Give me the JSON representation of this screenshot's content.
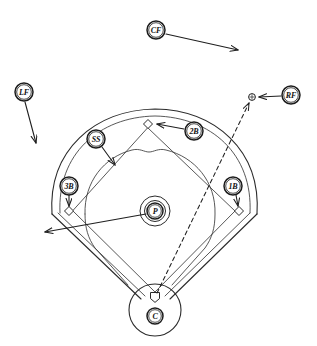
{
  "diagram": {
    "background_color": "#ffffff",
    "ink_color": "#1f1f1f",
    "width": 317,
    "height": 346
  },
  "positions": [
    {
      "id": "CF",
      "label": "CF",
      "name": "center-fielder",
      "badge": {
        "cx": 156,
        "cy": 30,
        "r": 9
      },
      "arrow": {
        "x1": 166,
        "y1": 34,
        "x2": 238,
        "y2": 50,
        "style": "solid",
        "head": "end"
      }
    },
    {
      "id": "LF",
      "label": "LF",
      "name": "left-fielder",
      "badge": {
        "cx": 24,
        "cy": 92,
        "r": 9
      },
      "arrow": {
        "x1": 25,
        "y1": 102,
        "x2": 36,
        "y2": 143,
        "style": "solid",
        "head": "end"
      }
    },
    {
      "id": "RF",
      "label": "RF",
      "name": "right-fielder",
      "badge": {
        "cx": 291,
        "cy": 95,
        "r": 9
      },
      "arrow": {
        "x1": 281,
        "y1": 96,
        "x2": 259,
        "y2": 97,
        "style": "solid",
        "head": "end"
      }
    },
    {
      "id": "2B",
      "label": "2B",
      "name": "second-baseman",
      "badge": {
        "cx": 194,
        "cy": 131,
        "r": 9
      },
      "arrow": {
        "x1": 184,
        "y1": 129,
        "x2": 157,
        "y2": 124,
        "style": "solid",
        "head": "end"
      }
    },
    {
      "id": "SS",
      "label": "SS",
      "name": "shortstop",
      "badge": {
        "cx": 96,
        "cy": 139,
        "r": 9
      },
      "arrow": {
        "x1": 102,
        "y1": 147,
        "x2": 115,
        "y2": 165,
        "style": "solid",
        "head": "end"
      }
    },
    {
      "id": "3B",
      "label": "3B",
      "name": "third-baseman",
      "badge": {
        "cx": 69,
        "cy": 186,
        "r": 9
      },
      "arrow": {
        "x1": 69,
        "y1": 195,
        "x2": 69,
        "y2": 206,
        "style": "solid",
        "head": "end"
      }
    },
    {
      "id": "1B",
      "label": "1B",
      "name": "first-baseman",
      "badge": {
        "cx": 233,
        "cy": 186,
        "r": 9
      },
      "arrow": {
        "x1": 236,
        "y1": 195,
        "x2": 238,
        "y2": 206,
        "style": "solid",
        "head": "end"
      }
    },
    {
      "id": "P",
      "label": "P",
      "name": "pitcher",
      "badge": {
        "cx": 155,
        "cy": 211,
        "r": 8
      },
      "arrow": {
        "x1": 146,
        "y1": 214,
        "x2": 45,
        "y2": 232,
        "style": "solid",
        "head": "end"
      }
    },
    {
      "id": "C",
      "label": "C",
      "name": "catcher",
      "badge": {
        "cx": 155,
        "cy": 316,
        "r": 8
      },
      "arrow": null
    }
  ],
  "bases": [
    {
      "name": "second-base",
      "cx": 148,
      "cy": 124,
      "size": 4.5
    },
    {
      "name": "third-base",
      "cx": 69,
      "cy": 211,
      "size": 4.5
    },
    {
      "name": "first-base",
      "cx": 239,
      "cy": 211,
      "size": 4.5
    },
    {
      "name": "home-plate",
      "cx": 155,
      "cy": 297,
      "size": 4.5
    }
  ],
  "ball_marker": {
    "name": "batted-ball-landing-marker",
    "cx": 252,
    "cy": 97,
    "r": 3.4
  },
  "hit_trajectory": {
    "name": "batted-ball-path",
    "from": {
      "x": 157,
      "y": 293
    },
    "to": {
      "x": 249,
      "y": 103
    },
    "style": "dashed",
    "head": "end"
  },
  "legend_note": ""
}
